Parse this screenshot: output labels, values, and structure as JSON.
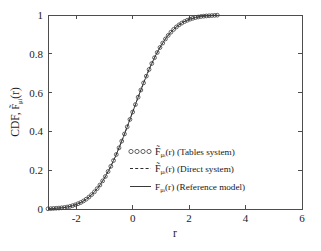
{
  "figure": {
    "background_color": "#ffffff",
    "axes_color": "#4d4d4d",
    "curve_color": "#3a3a3a",
    "marker_color": "#3c3c3c"
  },
  "axis": {
    "x_label": "r",
    "y_label_prefix": "CDF, ",
    "y_label_symbol": "F",
    "y_label_sub": "μ",
    "y_label_sub2": "i",
    "y_label_suffix": "(r)",
    "x_ticks": [
      "-2",
      "0",
      "2",
      "4",
      "6"
    ],
    "x_tick_values": [
      -2,
      0,
      2,
      4,
      6
    ],
    "y_ticks": [
      "0",
      "0.2",
      "0.4",
      "0.6",
      "0.8",
      "1"
    ],
    "y_tick_values": [
      0,
      0.2,
      0.4,
      0.6,
      0.8,
      1
    ]
  },
  "legend": {
    "entries": [
      {
        "marker": "circles",
        "marker_glyph": "○○○○",
        "symbol": "F",
        "accent": "̃",
        "subscript": "μ",
        "subscript2": "i",
        "arg": "(r)",
        "description": "(Tables system)",
        "label": "F̃μᵢ(r) (Tables system)"
      },
      {
        "marker": "dashed",
        "marker_glyph": "– – –",
        "symbol": "F",
        "accent": "̃",
        "subscript": "μ",
        "subscript2": "i",
        "arg": "(r)",
        "description": "(Direct system)",
        "label": "F̃μᵢ(r) (Direct system)"
      },
      {
        "marker": "solid",
        "marker_glyph": "——",
        "symbol": "F",
        "accent": "",
        "subscript": "μ",
        "subscript2": "i",
        "arg": "(r)",
        "description": "(Reference model)",
        "label": "Fμᵢ(r) (Reference model)"
      }
    ]
  },
  "chart_data": {
    "type": "line",
    "title": "",
    "xlabel": "r",
    "ylabel": "CDF, F̃μᵢ(r)",
    "xlim": [
      -3,
      6
    ],
    "ylim": [
      0,
      1
    ],
    "grid": false,
    "legend_position": "center",
    "x": [
      -3.0,
      -2.8,
      -2.6,
      -2.4,
      -2.2,
      -2.0,
      -1.8,
      -1.6,
      -1.4,
      -1.2,
      -1.0,
      -0.8,
      -0.6,
      -0.4,
      -0.2,
      0.0,
      0.2,
      0.4,
      0.6,
      0.8,
      1.0,
      1.2,
      1.4,
      1.6,
      1.8,
      2.0,
      2.2,
      2.4,
      2.6,
      2.8,
      3.0
    ],
    "series": [
      {
        "name": "F̃μᵢ(r) (Tables system)",
        "style": "markers",
        "marker": "circle",
        "values": [
          0.001,
          0.003,
          0.005,
          0.008,
          0.014,
          0.023,
          0.036,
          0.055,
          0.081,
          0.115,
          0.159,
          0.212,
          0.274,
          0.345,
          0.421,
          0.5,
          0.579,
          0.655,
          0.726,
          0.788,
          0.841,
          0.885,
          0.919,
          0.945,
          0.964,
          0.977,
          0.986,
          0.992,
          0.995,
          0.997,
          0.999
        ]
      },
      {
        "name": "F̃μᵢ(r) (Direct system)",
        "style": "dashed",
        "values": [
          0.001,
          0.003,
          0.005,
          0.008,
          0.014,
          0.023,
          0.036,
          0.055,
          0.081,
          0.115,
          0.159,
          0.212,
          0.274,
          0.345,
          0.421,
          0.5,
          0.579,
          0.655,
          0.726,
          0.788,
          0.841,
          0.885,
          0.919,
          0.945,
          0.964,
          0.977,
          0.986,
          0.992,
          0.995,
          0.997,
          0.999
        ]
      },
      {
        "name": "Fμᵢ(r) (Reference model)",
        "style": "solid",
        "values": [
          0.001,
          0.003,
          0.005,
          0.008,
          0.014,
          0.023,
          0.036,
          0.055,
          0.081,
          0.115,
          0.159,
          0.212,
          0.274,
          0.345,
          0.421,
          0.5,
          0.579,
          0.655,
          0.726,
          0.788,
          0.841,
          0.885,
          0.919,
          0.945,
          0.964,
          0.977,
          0.986,
          0.992,
          0.995,
          0.997,
          0.999
        ]
      }
    ]
  }
}
